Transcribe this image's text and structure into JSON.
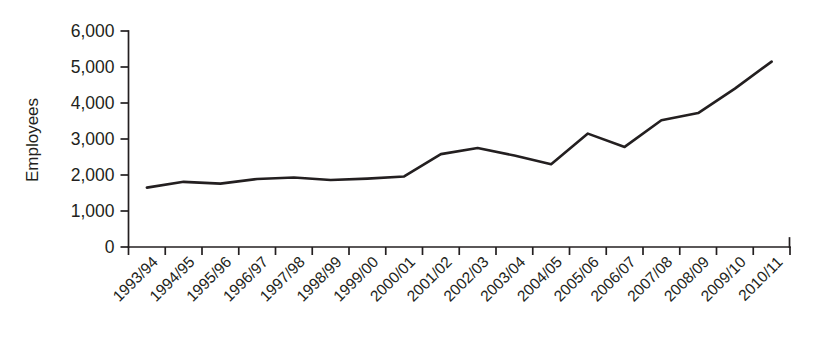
{
  "chart_data": {
    "type": "line",
    "title": "",
    "subtitle": "",
    "xlabel": "",
    "ylabel": "Employees",
    "ylim": [
      0,
      6000
    ],
    "ytick_values": [
      0,
      1000,
      2000,
      3000,
      4000,
      5000,
      6000
    ],
    "ytick_labels": [
      "0",
      "1,000",
      "2,000",
      "3,000",
      "4,000",
      "5,000",
      "6,000"
    ],
    "grid": false,
    "legend": false,
    "legend_position": "none",
    "line_color": "#231f20",
    "categories": [
      "1993/94",
      "1994/95",
      "1995/96",
      "1996/97",
      "1997/98",
      "1998/99",
      "1999/00",
      "2000/01",
      "2001/02",
      "2002/03",
      "2003/04",
      "2004/05",
      "2005/06",
      "2006/07",
      "2007/08",
      "2008/09",
      "2009/10",
      "2010/11"
    ],
    "values": [
      1650,
      1810,
      1760,
      1890,
      1930,
      1860,
      1900,
      1960,
      2580,
      2750,
      2540,
      2300,
      3150,
      2780,
      3520,
      3720,
      4400,
      5150
    ]
  }
}
